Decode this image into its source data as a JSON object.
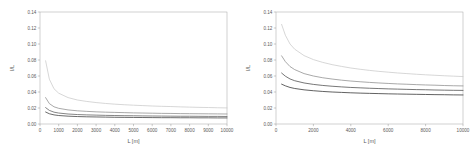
{
  "figure": {
    "panels": [
      "left",
      "right"
    ]
  },
  "chart_data": [
    {
      "type": "line",
      "panel": "left",
      "title": "",
      "xlabel": "L [m]",
      "ylabel": "I/L",
      "xlim": [
        0,
        10000
      ],
      "ylim": [
        0.0,
        0.14
      ],
      "xticks": [
        0,
        1000,
        2000,
        3000,
        4000,
        5000,
        6000,
        7000,
        8000,
        9000,
        10000
      ],
      "xticklabels": [
        "0",
        "1000",
        "2000",
        "3000",
        "4000",
        "5000",
        "6000",
        "7000",
        "8000",
        "9000",
        "10000"
      ],
      "yticks": [
        0.0,
        0.02,
        0.04,
        0.06,
        0.08,
        0.1,
        0.12,
        0.14
      ],
      "yticklabels": [
        "0.00",
        "0.02",
        "0.04",
        "0.06",
        "0.08",
        "0.10",
        "0.12",
        "0.14"
      ],
      "grid": false,
      "legend": "none",
      "x": [
        300,
        500,
        750,
        1000,
        1500,
        2000,
        2500,
        3000,
        3500,
        4000,
        4500,
        5000,
        5500,
        6000,
        6500,
        7000,
        7500,
        8000,
        8500,
        9000,
        9500,
        10000
      ],
      "series": [
        {
          "name": "curve-1",
          "color": "#c9c9c9",
          "values": [
            0.079,
            0.056,
            0.044,
            0.0385,
            0.033,
            0.03,
            0.0282,
            0.0268,
            0.0257,
            0.0248,
            0.0241,
            0.0235,
            0.023,
            0.0225,
            0.0221,
            0.0218,
            0.0214,
            0.0211,
            0.0208,
            0.0206,
            0.0203,
            0.0201
          ]
        },
        {
          "name": "curve-2",
          "color": "#8c8c8c",
          "values": [
            0.033,
            0.0255,
            0.0215,
            0.0196,
            0.0176,
            0.0165,
            0.0158,
            0.0152,
            0.0148,
            0.0145,
            0.0142,
            0.0139,
            0.0137,
            0.0135,
            0.0133,
            0.0132,
            0.013,
            0.0129,
            0.0128,
            0.0127,
            0.0126,
            0.0125
          ]
        },
        {
          "name": "curve-3",
          "color": "#5c5c5c",
          "values": [
            0.0205,
            0.017,
            0.0148,
            0.0137,
            0.0125,
            0.0118,
            0.0114,
            0.0111,
            0.0108,
            0.0106,
            0.0104,
            0.0103,
            0.0101,
            0.01,
            0.0099,
            0.0098,
            0.0097,
            0.0097,
            0.0096,
            0.0095,
            0.0095,
            0.0094
          ]
        },
        {
          "name": "curve-4",
          "color": "#3a3a3a",
          "values": [
            0.015,
            0.0128,
            0.0114,
            0.0106,
            0.0098,
            0.0093,
            0.009,
            0.0088,
            0.0086,
            0.0084,
            0.0083,
            0.0082,
            0.0081,
            0.008,
            0.0079,
            0.0079,
            0.0078,
            0.0078,
            0.0077,
            0.0077,
            0.0076,
            0.0076
          ]
        }
      ]
    },
    {
      "type": "line",
      "panel": "right",
      "title": "",
      "xlabel": "L [m]",
      "ylabel": "I/L",
      "xlim": [
        0,
        10000
      ],
      "ylim": [
        0.0,
        0.14
      ],
      "xticks": [
        0,
        2000,
        4000,
        6000,
        8000,
        10000
      ],
      "xticklabels": [
        "0",
        "2000",
        "4000",
        "6000",
        "8000",
        "10000"
      ],
      "yticks": [
        0.0,
        0.02,
        0.04,
        0.06,
        0.08,
        0.1,
        0.12,
        0.14
      ],
      "yticklabels": [
        "0.00",
        "0.02",
        "0.04",
        "0.06",
        "0.08",
        "0.10",
        "0.12",
        "0.14"
      ],
      "grid": false,
      "legend": "none",
      "x": [
        300,
        500,
        750,
        1000,
        1500,
        2000,
        2500,
        3000,
        3500,
        4000,
        4500,
        5000,
        5500,
        6000,
        6500,
        7000,
        7500,
        8000,
        8500,
        9000,
        9500,
        10000
      ],
      "series": [
        {
          "name": "curve-1",
          "color": "#c9c9c9",
          "values": [
            0.1245,
            0.111,
            0.1,
            0.0935,
            0.0855,
            0.0805,
            0.077,
            0.0742,
            0.072,
            0.07,
            0.0684,
            0.067,
            0.0658,
            0.0648,
            0.0638,
            0.063,
            0.0622,
            0.0615,
            0.0609,
            0.0603,
            0.0598,
            0.0593
          ]
        },
        {
          "name": "curve-2",
          "color": "#8c8c8c",
          "values": [
            0.0852,
            0.078,
            0.0718,
            0.068,
            0.063,
            0.06,
            0.0578,
            0.0562,
            0.0548,
            0.0537,
            0.0528,
            0.052,
            0.0513,
            0.0507,
            0.0501,
            0.0497,
            0.0492,
            0.0488,
            0.0485,
            0.0481,
            0.0478,
            0.0476
          ]
        },
        {
          "name": "curve-3",
          "color": "#4a4a4a",
          "values": [
            0.0637,
            0.0598,
            0.0563,
            0.0541,
            0.0513,
            0.0495,
            0.0482,
            0.0472,
            0.0464,
            0.0457,
            0.0452,
            0.0447,
            0.0443,
            0.0439,
            0.0436,
            0.0433,
            0.043,
            0.0428,
            0.0425,
            0.0423,
            0.0421,
            0.042
          ]
        },
        {
          "name": "curve-4",
          "color": "#2e2e2e",
          "values": [
            0.0498,
            0.0477,
            0.0457,
            0.0444,
            0.0427,
            0.0416,
            0.0407,
            0.04,
            0.0395,
            0.039,
            0.0386,
            0.0383,
            0.038,
            0.0377,
            0.0375,
            0.0373,
            0.0371,
            0.0369,
            0.0367,
            0.0366,
            0.0364,
            0.0363
          ]
        }
      ]
    }
  ]
}
